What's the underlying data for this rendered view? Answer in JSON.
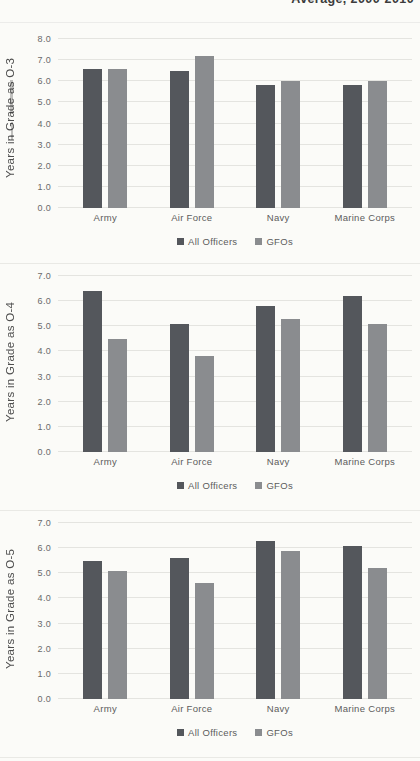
{
  "page": {
    "cropped_header_fragment": "Average, 2000-2010"
  },
  "colors": {
    "series_all_officers": "#54575c",
    "series_gfos": "#8a8c8f",
    "gridline": "#e4e4e0",
    "axis_text": "#6a6a6a",
    "background": "#fbfbf8"
  },
  "chart_data": [
    {
      "type": "bar",
      "title": "",
      "xlabel": "",
      "ylabel": "Years in Grade as O-3",
      "categories": [
        "Army",
        "Air Force",
        "Navy",
        "Marine Corps"
      ],
      "series": [
        {
          "name": "All Officers",
          "values": [
            6.6,
            6.5,
            5.8,
            5.8
          ]
        },
        {
          "name": "GFOs",
          "values": [
            6.6,
            7.2,
            6.0,
            6.0
          ]
        }
      ],
      "ylim": [
        0,
        8
      ],
      "ytick_step": 1.0,
      "grid": true,
      "legend_position": "bottom"
    },
    {
      "type": "bar",
      "title": "",
      "xlabel": "",
      "ylabel": "Years in Grade as O-4",
      "categories": [
        "Army",
        "Air Force",
        "Navy",
        "Marine Corps"
      ],
      "series": [
        {
          "name": "All Officers",
          "values": [
            6.4,
            5.1,
            5.8,
            6.2
          ]
        },
        {
          "name": "GFOs",
          "values": [
            4.5,
            3.8,
            5.3,
            5.1
          ]
        }
      ],
      "ylim": [
        0,
        7
      ],
      "ytick_step": 1.0,
      "grid": true,
      "legend_position": "bottom"
    },
    {
      "type": "bar",
      "title": "",
      "xlabel": "",
      "ylabel": "Years in Grade as O-5",
      "categories": [
        "Army",
        "Air Force",
        "Navy",
        "Marine Corps"
      ],
      "series": [
        {
          "name": "All Officers",
          "values": [
            5.5,
            5.6,
            6.3,
            6.1
          ]
        },
        {
          "name": "GFOs",
          "values": [
            5.1,
            4.6,
            5.9,
            5.2
          ]
        }
      ],
      "ylim": [
        0,
        7
      ],
      "ytick_step": 1.0,
      "grid": true,
      "legend_position": "bottom"
    }
  ]
}
